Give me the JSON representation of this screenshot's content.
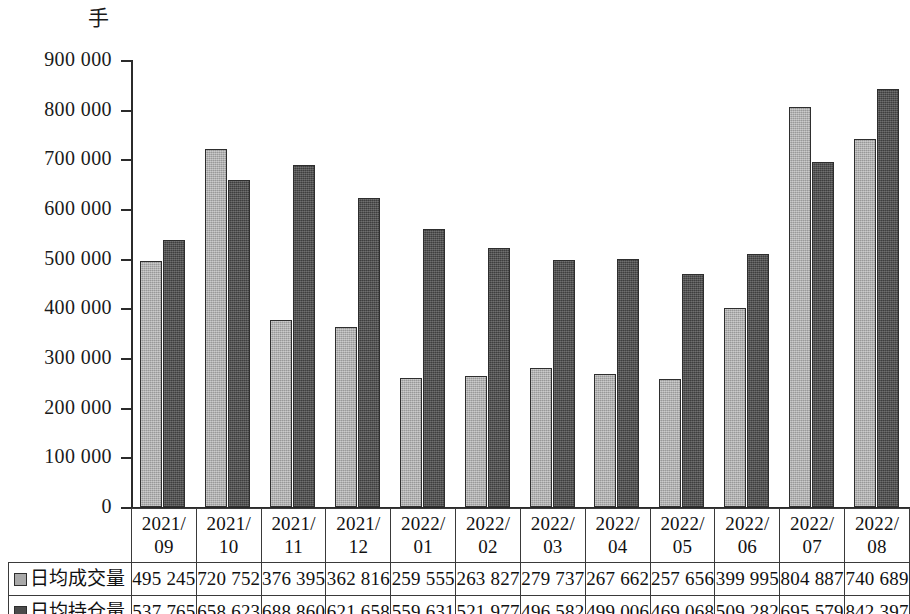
{
  "unit_label": "手",
  "chart_data": {
    "type": "bar",
    "title": "",
    "xlabel": "",
    "ylabel": "手",
    "ylim": [
      0,
      900000
    ],
    "ytick_labels": [
      "900 000",
      "800 000",
      "700 000",
      "600 000",
      "500 000",
      "400 000",
      "300 000",
      "200 000",
      "100 000",
      "0"
    ],
    "ytick_values": [
      900000,
      800000,
      700000,
      600000,
      500000,
      400000,
      300000,
      200000,
      100000,
      0
    ],
    "grid": false,
    "legend_position": "table-row-headers",
    "categories": [
      "2021/09",
      "2021/10",
      "2021/11",
      "2021/12",
      "2022/01",
      "2022/02",
      "2022/03",
      "2022/04",
      "2022/05",
      "2022/06",
      "2022/07",
      "2022/08"
    ],
    "category_lines": [
      [
        "2021/",
        "09"
      ],
      [
        "2021/",
        "10"
      ],
      [
        "2021/",
        "11"
      ],
      [
        "2021/",
        "12"
      ],
      [
        "2022/",
        "01"
      ],
      [
        "2022/",
        "02"
      ],
      [
        "2022/",
        "03"
      ],
      [
        "2022/",
        "04"
      ],
      [
        "2022/",
        "05"
      ],
      [
        "2022/",
        "06"
      ],
      [
        "2022/",
        "07"
      ],
      [
        "2022/",
        "08"
      ]
    ],
    "series": [
      {
        "name": "日均成交量",
        "color": "#a9a9a9",
        "values": [
          495245,
          720752,
          376395,
          362816,
          259555,
          263827,
          279737,
          267662,
          257656,
          399995,
          804887,
          740689
        ],
        "labels": [
          "495 245",
          "720 752",
          "376 395",
          "362 816",
          "259 555",
          "263 827",
          "279 737",
          "267 662",
          "257 656",
          "399 995",
          "804 887",
          "740 689"
        ]
      },
      {
        "name": "日均持仓量",
        "color": "#4b4b4b",
        "values": [
          537765,
          658623,
          688860,
          621658,
          559631,
          521977,
          496582,
          499006,
          469068,
          509282,
          695579,
          842397
        ],
        "labels": [
          "537 765",
          "658 623",
          "688 860",
          "621 658",
          "559 631",
          "521 977",
          "496 582",
          "499 006",
          "469 068",
          "509 282",
          "695 579",
          "842 397"
        ]
      }
    ]
  }
}
